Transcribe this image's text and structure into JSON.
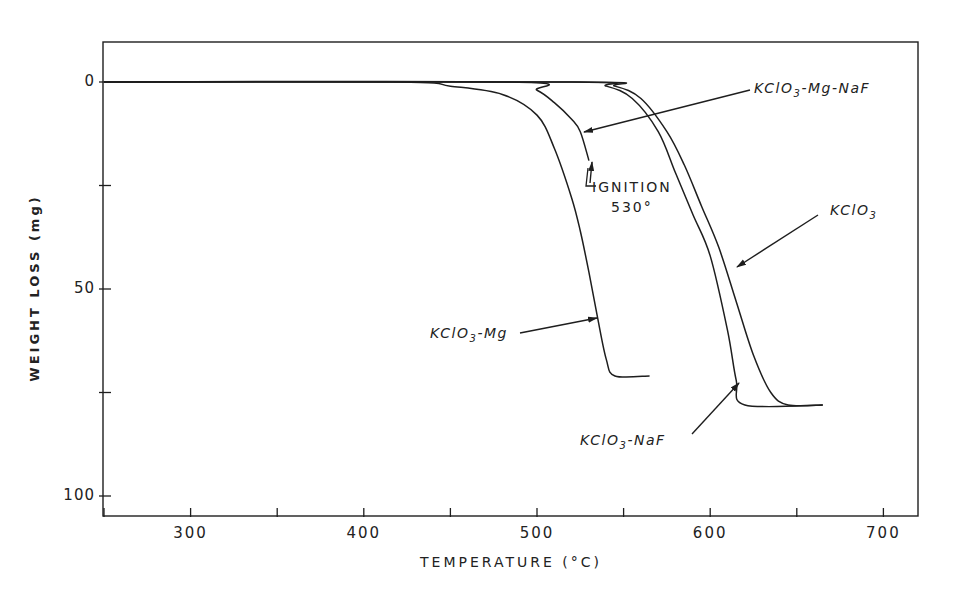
{
  "chart_data": {
    "type": "line",
    "title": "",
    "xlabel": "TEMPERATURE (°C)",
    "ylabel": "WEIGHT LOSS (mg)",
    "xlim": [
      250,
      720
    ],
    "ylim": [
      0,
      105
    ],
    "y_inverted": true,
    "grid": false,
    "x_ticks": [
      250,
      300,
      350,
      400,
      450,
      500,
      550,
      600,
      650,
      700
    ],
    "x_tick_labels": [
      "300",
      "400",
      "500",
      "600",
      "700"
    ],
    "y_ticks": [
      0,
      25,
      50,
      75,
      100
    ],
    "y_tick_labels": [
      "0",
      "50",
      "100"
    ],
    "series": [
      {
        "name": "KClO3-Mg",
        "label_display": "KClO3-Mg",
        "x": [
          250,
          420,
          450,
          480,
          500,
          510,
          520,
          525,
          530,
          535,
          540,
          545,
          565
        ],
        "y": [
          0,
          0,
          1,
          3,
          8,
          16,
          28,
          36,
          46,
          57,
          67,
          71,
          71
        ]
      },
      {
        "name": "KClO3-Mg-NaF",
        "label_display": "KClO3-Mg-NaF",
        "x": [
          250,
          485,
          500,
          510,
          520,
          525,
          530
        ],
        "y": [
          0,
          0,
          2,
          5,
          9,
          12,
          19
        ],
        "annotation": "IGNITION 530°"
      },
      {
        "name": "KClO3-NaF",
        "label_display": "KClO3-NaF",
        "x": [
          250,
          520,
          540,
          555,
          570,
          580,
          590,
          600,
          610,
          615,
          620,
          665
        ],
        "y": [
          0,
          0,
          1,
          4,
          12,
          22,
          32,
          42,
          60,
          72,
          78,
          78
        ]
      },
      {
        "name": "KClO3",
        "label_display": "KClO3",
        "x": [
          250,
          525,
          545,
          560,
          575,
          585,
          595,
          605,
          615,
          625,
          635,
          645,
          665
        ],
        "y": [
          0,
          0,
          1,
          4,
          12,
          20,
          30,
          40,
          53,
          66,
          75,
          78,
          78
        ]
      }
    ],
    "annotations": [
      {
        "text": "IGNITION",
        "sub": "530°",
        "series": "KClO3-Mg-NaF"
      }
    ],
    "legend": "inline labels with arrows"
  },
  "labels": {
    "kmg": {
      "pre": "KClO",
      "sub": "3",
      "post": "-Mg"
    },
    "kmgnaf": {
      "pre": "KClO",
      "sub": "3",
      "post": "-Mg-NaF"
    },
    "knaf": {
      "pre": "KClO",
      "sub": "3",
      "post": "-NaF"
    },
    "k": {
      "pre": "KClO",
      "sub": "3",
      "post": ""
    },
    "ignition": "IGNITION",
    "ignition_temp": "530°"
  },
  "axes": {
    "x_title": "TEMPERATURE (°C)",
    "y_title": "WEIGHT LOSS (mg)",
    "x_tick_labels": [
      "300",
      "400",
      "500",
      "600",
      "700"
    ],
    "y_tick_labels": [
      "0",
      "50",
      "100"
    ]
  },
  "style": {
    "line_color": "#1e1e1e",
    "background": "#ffffff"
  }
}
